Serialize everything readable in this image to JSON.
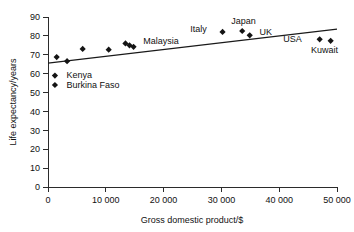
{
  "chart_data": {
    "type": "scatter",
    "title": "",
    "xlabel": "Gross domestic product/$",
    "ylabel": "Life expectancy/years",
    "xlim": [
      0,
      50000
    ],
    "ylim": [
      0,
      90
    ],
    "grid": false,
    "legend": "none",
    "xticks": [
      0,
      10000,
      20000,
      30000,
      40000,
      50000
    ],
    "xtick_labels": [
      "0",
      "10 000",
      "20 000",
      "30 000",
      "40 000",
      "50 000"
    ],
    "yticks": [
      0,
      10,
      20,
      30,
      40,
      50,
      60,
      70,
      80,
      90
    ],
    "ytick_labels": [
      "0",
      "10",
      "20",
      "30",
      "40",
      "50",
      "60",
      "70",
      "80",
      "90"
    ],
    "marker_shape": "diamond",
    "marker_color": "#141414",
    "points": [
      {
        "name": "point-1",
        "x": 1500,
        "y": 68.8,
        "label": ""
      },
      {
        "name": "point-2",
        "x": 3300,
        "y": 66.6,
        "label": ""
      },
      {
        "name": "point-3",
        "x": 6000,
        "y": 73.1,
        "label": ""
      },
      {
        "name": "point-4",
        "x": 10500,
        "y": 72.7,
        "label": ""
      },
      {
        "name": "point-malaysia-a",
        "x": 13400,
        "y": 76.0,
        "label": ""
      },
      {
        "name": "point-malaysia-b",
        "x": 14100,
        "y": 75.0,
        "label": "Malaysia"
      },
      {
        "name": "point-malaysia-c",
        "x": 14800,
        "y": 74.2,
        "label": ""
      },
      {
        "name": "point-italy",
        "x": 30200,
        "y": 82.1,
        "label": "Italy"
      },
      {
        "name": "point-japan",
        "x": 33600,
        "y": 82.6,
        "label": "Japan"
      },
      {
        "name": "point-uk",
        "x": 34900,
        "y": 80.3,
        "label": "UK"
      },
      {
        "name": "point-usa",
        "x": 47000,
        "y": 78.2,
        "label": "USA"
      },
      {
        "name": "point-kuwait",
        "x": 48900,
        "y": 77.4,
        "label": "Kuwait"
      },
      {
        "name": "point-kenya",
        "x": 1200,
        "y": 59.0,
        "label": "Kenya"
      },
      {
        "name": "point-burkina-faso",
        "x": 1200,
        "y": 54.0,
        "label": "Burkina Faso"
      }
    ],
    "trend_line": {
      "name": "line-of-best-fit",
      "x_start": 0,
      "y_start": 65.6,
      "x_end": 50000,
      "y_end": 83.6
    },
    "annotations": [
      {
        "name": "annotation-malaysia",
        "text": "Malaysia",
        "x": 16500,
        "y": 77.5
      },
      {
        "name": "annotation-italy",
        "text": "Italy",
        "x": 24600,
        "y": 84.0
      },
      {
        "name": "annotation-japan",
        "text": "Japan",
        "x": 31700,
        "y": 88.0
      },
      {
        "name": "annotation-uk",
        "text": "UK",
        "x": 36600,
        "y": 82.2
      },
      {
        "name": "annotation-usa",
        "text": "USA",
        "x": 40700,
        "y": 78.4
      },
      {
        "name": "annotation-kuwait",
        "text": "Kuwait",
        "x": 45500,
        "y": 72.8
      },
      {
        "name": "annotation-kenya",
        "text": "Kenya",
        "x": 3200,
        "y": 59.3
      },
      {
        "name": "annotation-burkina-faso",
        "text": "Burkina Faso",
        "x": 3200,
        "y": 54.3
      }
    ]
  }
}
